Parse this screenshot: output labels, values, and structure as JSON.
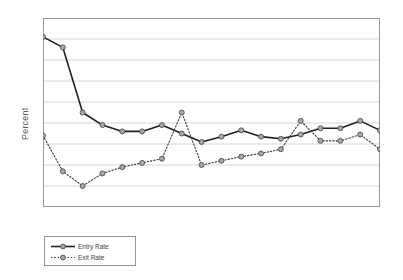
{
  "chart_data": {
    "type": "line",
    "title": "",
    "xlabel": "",
    "ylabel": "Percent",
    "ylim": [
      0,
      9
    ],
    "xlim": [
      1990,
      2007
    ],
    "grid": true,
    "legend_position": "below-left",
    "x": [
      1990,
      1991,
      1992,
      1993,
      1994,
      1995,
      1996,
      1997,
      1998,
      1999,
      2000,
      2001,
      2002,
      2003,
      2004,
      2005,
      2006,
      2007
    ],
    "xticks": [
      1990,
      1995,
      2000,
      2005
    ],
    "yticks": [
      0,
      1,
      2,
      3,
      4,
      5,
      6,
      7,
      8,
      9
    ],
    "series": [
      {
        "name": "Entry Rate",
        "style": "solid",
        "color": "#231f20",
        "values": [
          8.1,
          7.6,
          4.5,
          3.9,
          3.6,
          3.6,
          3.9,
          3.5,
          3.1,
          3.35,
          3.65,
          3.35,
          3.25,
          3.45,
          3.75,
          3.75,
          4.1,
          3.65
        ]
      },
      {
        "name": "Exit Rate",
        "style": "dotted",
        "color": "#3a3a3c",
        "values": [
          3.4,
          1.7,
          1.0,
          1.6,
          1.9,
          2.1,
          2.3,
          4.5,
          2.0,
          2.2,
          2.4,
          2.55,
          2.75,
          4.1,
          3.15,
          3.15,
          3.45,
          2.75
        ]
      }
    ]
  },
  "legend": {
    "entry_label": "Entry Rate",
    "exit_label": "Exit Rate"
  },
  "colors": {
    "entry_line": "#231f20",
    "exit_line": "#3a3a3c",
    "marker_fill": "#a7a9ac",
    "marker_stroke": "#414042",
    "grid": "#c9cbcd",
    "frame": "#8d8f91",
    "text": "#58595b"
  }
}
